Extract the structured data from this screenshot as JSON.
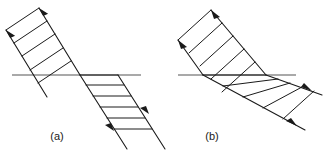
{
  "figure": {
    "width": 325,
    "height": 153,
    "background_color": "#ffffff",
    "stroke_color": "#1a1a1a",
    "boundary_color": "#808080",
    "caption_color": "#1a1a1a"
  },
  "panels": [
    {
      "id": "a",
      "caption": "(a)",
      "caption_x": 57,
      "caption_y": 140,
      "description": "Beam refracts toward the normal; wavefront spacing decreases below the boundary",
      "boundary": {
        "x1": 12,
        "y1": 75,
        "x2": 141,
        "y2": 75,
        "width": 1.6,
        "color": "#8c8c8c"
      },
      "incident": {
        "direction_deg": 238,
        "rays": [
          {
            "x1": 39,
            "y1": 8,
            "x2": 80,
            "y2": 75
          },
          {
            "x1": 6,
            "y1": 30,
            "x2": 47,
            "y2": 97
          }
        ],
        "arrows": [
          {
            "x": 41,
            "y": 11,
            "angle_deg": 238
          },
          {
            "x": 8,
            "y": 33,
            "angle_deg": 238
          }
        ],
        "wavefront_count": 5,
        "wavefront_spacing_px": 13
      },
      "refracted": {
        "direction_deg": 296,
        "rays": [
          {
            "x1": 80,
            "y1": 75,
            "x2": 127,
            "y2": 149
          },
          {
            "x1": 118,
            "y1": 75,
            "x2": 165,
            "y2": 149
          }
        ],
        "arrows": [
          {
            "x": 115,
            "y": 130,
            "angle_deg": 302
          },
          {
            "x": 147,
            "y": 112,
            "angle_deg": 302
          }
        ],
        "wavefront_count": 6,
        "wavefront_spacing_px": 10
      }
    },
    {
      "id": "b",
      "caption": "(b)",
      "caption_x": 212,
      "caption_y": 140,
      "description": "Beam refracts away from the normal; wavefront spacing increases below the boundary",
      "boundary": {
        "x1": 178,
        "y1": 75,
        "x2": 296,
        "y2": 75,
        "width": 1.6,
        "color": "#8c8c8c"
      },
      "incident": {
        "direction_deg": 232,
        "rays": [
          {
            "x1": 211,
            "y1": 10,
            "x2": 266,
            "y2": 75
          },
          {
            "x1": 178,
            "y1": 40,
            "x2": 203,
            "y2": 75
          }
        ],
        "arrows": [
          {
            "x": 214,
            "y": 14,
            "angle_deg": 232
          },
          {
            "x": 181,
            "y": 44,
            "angle_deg": 232
          }
        ],
        "wavefront_count": 5,
        "wavefront_spacing_px": 14
      },
      "refracted": {
        "direction_deg": 323,
        "rays": [
          {
            "x1": 203,
            "y1": 75,
            "x2": 305,
            "y2": 130
          },
          {
            "x1": 266,
            "y1": 75,
            "x2": 318,
            "y2": 92
          }
        ],
        "arrows": [
          {
            "x": 296,
            "y": 125,
            "angle_deg": 330
          },
          {
            "x": 310,
            "y": 89,
            "angle_deg": 330
          }
        ],
        "wavefront_count": 6,
        "wavefront_spacing_px": 20
      }
    }
  ]
}
